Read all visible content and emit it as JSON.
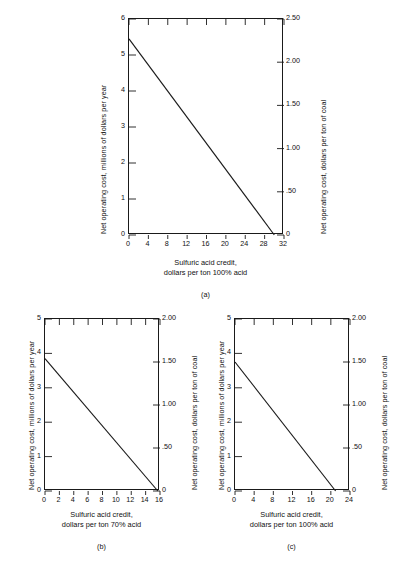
{
  "figure": {
    "caption": "",
    "background": "#ffffff",
    "line_color": "#1a1a1a",
    "axis_color": "#1a1a1a"
  },
  "chart_data": [
    {
      "id": "a",
      "type": "line",
      "title": "",
      "panel_label": "(a)",
      "xlabel_line1": "Sulfuric acid credit,",
      "xlabel_line2": "dollars per ton 100% acid",
      "ylabel": "Net operating cost, millions of dollars per year",
      "ylabel_right": "Net operating cost, dollars per ton of coal",
      "xlim": [
        0,
        32
      ],
      "ylim": [
        0,
        6
      ],
      "ylim_right": [
        0,
        2.5
      ],
      "xticks": [
        0,
        4,
        8,
        12,
        16,
        20,
        24,
        28,
        32
      ],
      "xticklabels": [
        "0",
        "4",
        "8",
        "12",
        "16",
        "20",
        "24",
        "28",
        "32"
      ],
      "yticks": [
        0,
        1,
        2,
        3,
        4,
        5,
        6
      ],
      "yticklabels": [
        "0",
        "1",
        "2",
        "3",
        "4",
        "5",
        "6"
      ],
      "yticks_right": [
        0,
        0.5,
        1.0,
        1.5,
        2.0,
        2.5
      ],
      "yticklabels_right": [
        "0",
        ".50",
        "1.00",
        "1.50",
        "2.00",
        "2.50"
      ],
      "grid": false,
      "legend": null,
      "series": [
        {
          "name": "net operating cost",
          "x": [
            0,
            30
          ],
          "y": [
            5.45,
            0
          ]
        }
      ]
    },
    {
      "id": "b",
      "type": "line",
      "title": "",
      "panel_label": "(b)",
      "xlabel_line1": "Sulfuric acid credit,",
      "xlabel_line2": "dollars per ton 70% acid",
      "ylabel": "Net operating cost, millions of dollars per year",
      "ylabel_right": "Net operating cost, dollars per ton of coal",
      "xlim": [
        0,
        16
      ],
      "ylim": [
        0,
        5
      ],
      "ylim_right": [
        0,
        2.0
      ],
      "xticks": [
        0,
        2,
        4,
        6,
        8,
        10,
        12,
        14,
        16
      ],
      "xticklabels": [
        "0",
        "2",
        "4",
        "6",
        "8",
        "10",
        "12",
        "14",
        "16"
      ],
      "yticks": [
        0,
        1,
        2,
        3,
        4,
        5
      ],
      "yticklabels": [
        "0",
        "1",
        "2",
        "3",
        "4",
        "5"
      ],
      "yticks_right": [
        0,
        0.5,
        1.0,
        1.5,
        2.0
      ],
      "yticklabels_right": [
        "0",
        ".50",
        "1.00",
        "1.50",
        "2.00"
      ],
      "grid": false,
      "legend": null,
      "series": [
        {
          "name": "net operating cost",
          "x": [
            0,
            15.7
          ],
          "y": [
            3.85,
            0
          ]
        }
      ]
    },
    {
      "id": "c",
      "type": "line",
      "title": "",
      "panel_label": "(c)",
      "xlabel_line1": "Sulfuric acid credit,",
      "xlabel_line2": "dollars per ton 100% acid",
      "ylabel": "Net operating cost, millions of dollars per year",
      "ylabel_right": "Net operating cost, dollars per ton of coal",
      "xlim": [
        0,
        24
      ],
      "ylim": [
        0,
        5
      ],
      "ylim_right": [
        0,
        2.0
      ],
      "xticks": [
        0,
        4,
        8,
        12,
        16,
        20,
        24
      ],
      "xticklabels": [
        "0",
        "4",
        "8",
        "12",
        "16",
        "20",
        "24"
      ],
      "yticks": [
        0,
        1,
        2,
        3,
        4,
        5
      ],
      "yticklabels": [
        "0",
        "1",
        "2",
        "3",
        "4",
        "5"
      ],
      "yticks_right": [
        0,
        0.5,
        1.0,
        1.5,
        2.0
      ],
      "yticklabels_right": [
        "0",
        ".50",
        "1.00",
        "1.50",
        "2.00"
      ],
      "grid": false,
      "legend": null,
      "series": [
        {
          "name": "net operating cost",
          "x": [
            0,
            21
          ],
          "y": [
            3.75,
            0
          ]
        }
      ]
    }
  ]
}
